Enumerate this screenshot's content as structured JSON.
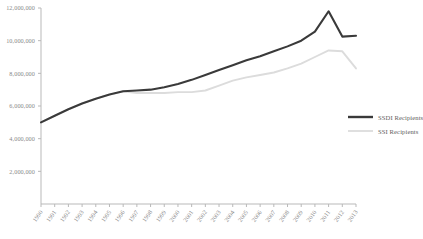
{
  "chart_data": {
    "type": "line",
    "title": "",
    "subtitle": "",
    "xlabel": "",
    "ylabel": "",
    "grid": false,
    "legend_position": "right",
    "x": [
      1990,
      1991,
      1992,
      1993,
      1994,
      1995,
      1996,
      1997,
      1998,
      1999,
      2000,
      2001,
      2002,
      2003,
      2004,
      2005,
      2006,
      2007,
      2008,
      2009,
      2010,
      2011,
      2012,
      2013
    ],
    "xlim": [
      1990,
      2013
    ],
    "ylim": [
      0,
      12000000
    ],
    "ytick_values": [
      2000000,
      4000000,
      6000000,
      8000000,
      10000000,
      12000000
    ],
    "ytick_labels": [
      "2,000,000",
      "4,000,000",
      "6,000,000",
      "8,000,000",
      "10,000,000",
      "12,000,000"
    ],
    "xtick_labels": [
      "1990",
      "1991",
      "1992",
      "1993",
      "1994",
      "1995",
      "1996",
      "1997",
      "1998",
      "1999",
      "2000",
      "2001",
      "2002",
      "2003",
      "2004",
      "2005",
      "2006",
      "2007",
      "2008",
      "2009",
      "2010",
      "2011",
      "2012",
      "2013"
    ],
    "series": [
      {
        "name": "SSDI Recipients",
        "color": "#3a3a3a",
        "values": [
          5000000,
          5400000,
          5800000,
          6150000,
          6450000,
          6700000,
          6900000,
          6950000,
          7000000,
          7150000,
          7350000,
          7600000,
          7900000,
          8200000,
          8500000,
          8800000,
          9050000,
          9350000,
          9650000,
          10000000,
          10550000,
          11800000,
          10250000,
          10300000
        ]
      },
      {
        "name": "SSI Recipients",
        "color": "#dcdcdc",
        "values": [
          5000000,
          5400000,
          5800000,
          6150000,
          6450000,
          6700000,
          6900000,
          6800000,
          6800000,
          6800000,
          6850000,
          6850000,
          6950000,
          7250000,
          7550000,
          7750000,
          7900000,
          8050000,
          8300000,
          8600000,
          9000000,
          9400000,
          9350000,
          8300000
        ]
      }
    ]
  },
  "legend": {
    "entries": [
      {
        "label": "SSDI Recipients",
        "color": "#3a3a3a",
        "style": "thick"
      },
      {
        "label": "SSI Recipients",
        "color": "#dcdcdc",
        "style": "thin"
      }
    ]
  }
}
